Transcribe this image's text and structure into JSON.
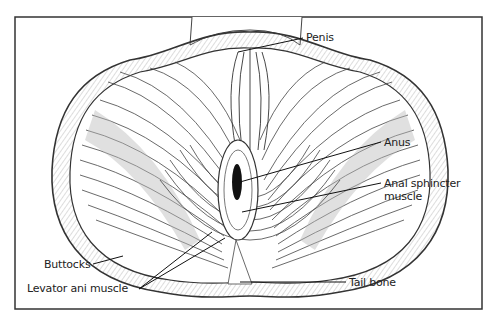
{
  "diagram": {
    "frame": {
      "x": 15,
      "y": 17,
      "width": 467,
      "height": 292,
      "stroke": "#333333"
    },
    "labels": [
      {
        "id": "penis",
        "text": "Penis",
        "x": 306,
        "y": 30,
        "leader": [
          [
            303,
            38
          ],
          [
            238,
            52
          ]
        ]
      },
      {
        "id": "anus",
        "text": "Anus",
        "x": 384,
        "y": 137,
        "leader": [
          [
            381,
            142
          ],
          [
            240,
            182
          ]
        ]
      },
      {
        "id": "anal-sphincter",
        "text": "Anal sphincter\nmuscle",
        "x": 384,
        "y": 179,
        "leader": [
          [
            381,
            183
          ],
          [
            242,
            212
          ]
        ]
      },
      {
        "id": "buttocks",
        "text": "Buttocks",
        "x": 44,
        "y": 259,
        "leader": [
          [
            93,
            264
          ],
          [
            123,
            256
          ]
        ]
      },
      {
        "id": "levator-ani",
        "text": "Levator ani muscle",
        "x": 27,
        "y": 283,
        "leader": [
          [
            139,
            289
          ],
          [
            225,
            238
          ]
        ],
        "leader2": [
          [
            139,
            289
          ],
          [
            215,
            235
          ]
        ]
      },
      {
        "id": "tail-bone",
        "text": "Tail bone",
        "x": 349,
        "y": 277,
        "leader": [
          [
            346,
            282
          ],
          [
            240,
            282
          ]
        ]
      }
    ],
    "colors": {
      "ink": "#222222",
      "shade": "#9a9a9a",
      "background": "#ffffff"
    }
  }
}
